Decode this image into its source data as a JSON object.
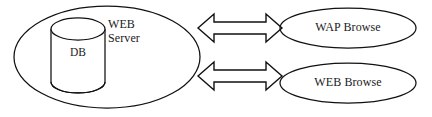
{
  "diagram": {
    "type": "architecture-block-diagram",
    "background_color": "#ffffff",
    "stroke_color": "#111111",
    "server_group": {
      "shape": "ellipse",
      "label_line_1": "WEB",
      "label_line_2": "Server",
      "database": {
        "shape": "cylinder",
        "label": "DB"
      }
    },
    "connectors": [
      {
        "name": "server-to-wap-browser",
        "style": "double-headed-block-arrow",
        "direction": "bidirectional"
      },
      {
        "name": "server-to-web-browser",
        "style": "double-headed-block-arrow",
        "direction": "bidirectional"
      }
    ],
    "clients": [
      {
        "name": "wap-browser",
        "shape": "ellipse",
        "label": "WAP Browse"
      },
      {
        "name": "web-browser",
        "shape": "ellipse",
        "label": "WEB Browse"
      }
    ]
  }
}
